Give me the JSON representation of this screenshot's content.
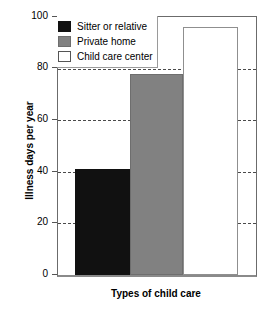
{
  "chart_data": {
    "type": "bar",
    "title": "",
    "xlabel": "Types of child care",
    "ylabel": "Illness days per year",
    "categories": [
      "Sitter or relative",
      "Private home",
      "Child care center"
    ],
    "values": [
      41,
      78,
      96
    ],
    "series": [
      {
        "name": "Illness days per year",
        "values": [
          41,
          78,
          96
        ]
      }
    ],
    "ylim": [
      0,
      100
    ],
    "yticks": [
      0,
      20,
      40,
      60,
      80,
      100
    ],
    "ytick_labels": [
      "0",
      "20",
      "40",
      "60",
      "80",
      "100"
    ],
    "grid": "horizontal-dashed",
    "legend_position": "top-left-inside",
    "legend": [
      {
        "label": "Sitter or relative",
        "color": "#111111",
        "swatch": "sw-black"
      },
      {
        "label": "Private home",
        "color": "#818181",
        "swatch": "sw-gray"
      },
      {
        "label": "Child care center",
        "color": "#ffffff",
        "swatch": "sw-white"
      }
    ],
    "bar_colors": [
      "#111111",
      "#818181",
      "#ffffff"
    ]
  },
  "axes": {
    "y_title": "Illness days per year",
    "x_title": "Types of child care",
    "y_tick_0": "0",
    "y_tick_20": "20",
    "y_tick_40": "40",
    "y_tick_60": "60",
    "y_tick_80": "80",
    "y_tick_100": "100"
  },
  "legend": {
    "item_0": "Sitter or relative",
    "item_1": "Private home",
    "item_2": "Child care center"
  },
  "colors": {
    "bar_sitter": "#111111",
    "bar_private_home": "#818181",
    "bar_child_care_center": "#ffffff",
    "axis": "#6b6b6b",
    "gridline": "#4a4a4a",
    "background": "#ffffff"
  }
}
